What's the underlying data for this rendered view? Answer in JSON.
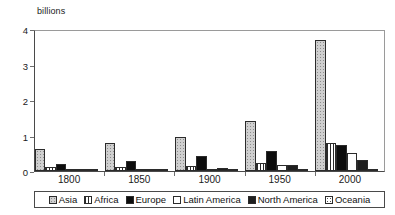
{
  "chart_data": {
    "type": "bar",
    "title": "",
    "subtitle": "",
    "unit_caption": "billions",
    "xlabel": "",
    "ylabel": "billions",
    "ylim": [
      0,
      4
    ],
    "ytick_labels": [
      "0",
      "1",
      "2",
      "3",
      "4"
    ],
    "ytick_values": [
      0,
      1,
      2,
      3,
      4
    ],
    "grid": false,
    "legend_position": "bottom",
    "categories": [
      "1800",
      "1850",
      "1900",
      "1950",
      "2000"
    ],
    "series": [
      {
        "name": "Asia",
        "pattern": "light-speckle",
        "values": [
          0.63,
          0.8,
          0.95,
          1.4,
          3.7
        ]
      },
      {
        "name": "Africa",
        "pattern": "vertical-hatch",
        "values": [
          0.1,
          0.11,
          0.13,
          0.23,
          0.8
        ]
      },
      {
        "name": "Europe",
        "pattern": "solid-black",
        "values": [
          0.2,
          0.27,
          0.41,
          0.55,
          0.73
        ]
      },
      {
        "name": "Latin America",
        "pattern": "white",
        "values": [
          0.02,
          0.04,
          0.07,
          0.17,
          0.52
        ]
      },
      {
        "name": "North America",
        "pattern": "dark-speckle",
        "values": [
          0.01,
          0.03,
          0.08,
          0.17,
          0.31
        ]
      },
      {
        "name": "Oceania",
        "pattern": "sparse-dots",
        "values": [
          0.002,
          0.003,
          0.006,
          0.013,
          0.031
        ]
      }
    ]
  },
  "legend": {
    "items": [
      {
        "label": "Asia"
      },
      {
        "label": "Africa"
      },
      {
        "label": "Europe"
      },
      {
        "label": "Latin America"
      },
      {
        "label": "North America"
      },
      {
        "label": "Oceania"
      }
    ]
  },
  "colors": {
    "axis": "#4a4a4a",
    "text": "#1a1a1a",
    "bar_outline": "#2b2b2b",
    "background": "#ffffff"
  }
}
